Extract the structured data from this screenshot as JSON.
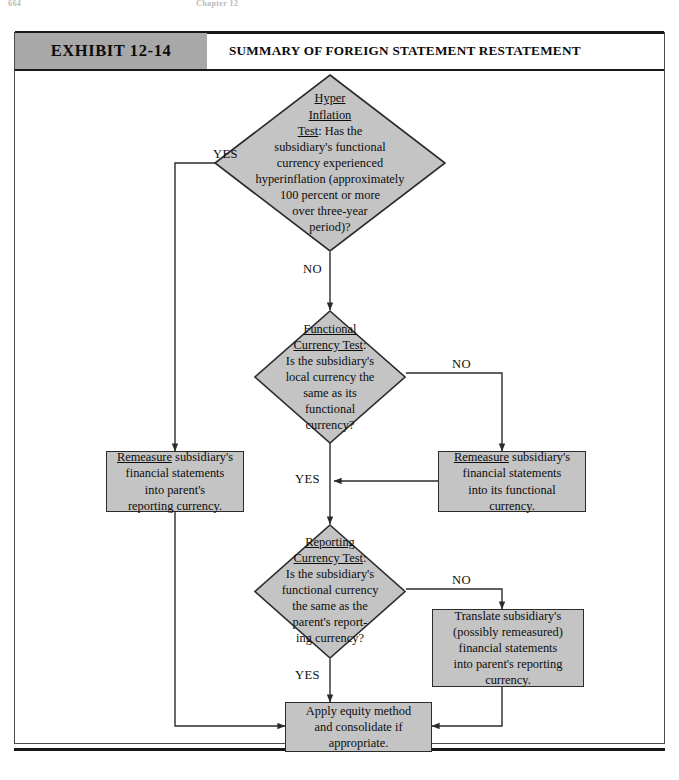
{
  "page_header": {
    "folio": "664",
    "chapter": "Chapter 12"
  },
  "exhibit": {
    "number_label": "EXHIBIT 12-14",
    "title": "SUMMARY OF FOREIGN STATEMENT RESTATEMENT"
  },
  "colors": {
    "shape_fill": "#c4c4c4",
    "header_fill": "#a8a8a8",
    "stroke": "#2b2b2b",
    "page_background": "#ffffff"
  },
  "flow": {
    "decisions": [
      {
        "id": "hyperinflation-test",
        "title_lines": [
          "Hyper",
          "Inflation",
          "Test"
        ],
        "body": ": Has the subsidiary's functional currency experienced hyperinflation (approximately 100 percent or more over three-year period)?",
        "body_lines": [
          ": Has the",
          "subsidiary's functional",
          "currency experienced",
          "hyperinflation (approximately",
          "100 percent or more",
          "over three-year",
          "period)?"
        ],
        "yes_label": "YES",
        "no_label": "NO"
      },
      {
        "id": "functional-currency-test",
        "title_lines": [
          "Functional",
          "Currency Test"
        ],
        "body": ": Is the subsidiary's local currency the same as its functional currency?",
        "body_lines": [
          "Is the subsidiary's",
          "local currency the",
          "same as its",
          "functional",
          "currency?"
        ],
        "yes_label": "YES",
        "no_label": "NO"
      },
      {
        "id": "reporting-currency-test",
        "title_lines": [
          "Reporting",
          "Currency Test"
        ],
        "body": ": Is the subsidiary's functional currency the same as the parent's reporting currency?",
        "body_lines": [
          "Is the subsidiary's",
          "functional currency",
          "the same as the",
          "parent's report-",
          "ing currency?"
        ],
        "yes_label": "YES",
        "no_label": "NO"
      }
    ],
    "processes": [
      {
        "id": "remeasure-into-parent",
        "underlined_word": "Remeasure",
        "lines": [
          "Remeasure subsidiary's",
          "financial statements",
          "into parent's",
          "reporting currency."
        ]
      },
      {
        "id": "remeasure-into-functional",
        "underlined_word": "Remeasure",
        "lines": [
          "Remeasure subsidiary's",
          "financial statements",
          "into its functional",
          "currency."
        ]
      },
      {
        "id": "translate-into-parent",
        "underlined_word": "",
        "lines": [
          "Translate subsidiary's",
          "(possibly remeasured)",
          "financial statements",
          "into parent's reporting",
          "currency."
        ]
      },
      {
        "id": "apply-equity-method",
        "underlined_word": "",
        "lines": [
          "Apply equity method",
          "and consolidate if",
          "appropriate."
        ]
      }
    ],
    "edge_labels": [
      {
        "id": "edge-hyper-yes",
        "text": "YES"
      },
      {
        "id": "edge-hyper-no",
        "text": "NO"
      },
      {
        "id": "edge-functional-no",
        "text": "NO"
      },
      {
        "id": "edge-functional-yes",
        "text": "YES"
      },
      {
        "id": "edge-reporting-no",
        "text": "NO"
      },
      {
        "id": "edge-reporting-yes",
        "text": "YES"
      }
    ]
  }
}
